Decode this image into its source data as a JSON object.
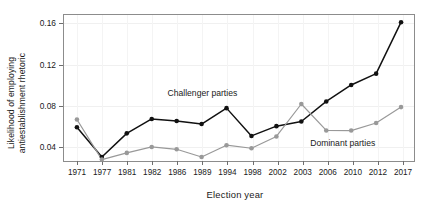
{
  "chart_data": {
    "type": "line",
    "title": "",
    "xlabel": "Election year",
    "ylabel": "Likelihood of employing antiestablishment rhetoric",
    "ylabel_lines": [
      "Likelihood of employing",
      "antiestablishment rhetoric"
    ],
    "categories": [
      "1971",
      "1977",
      "1981",
      "1982",
      "1986",
      "1989",
      "1994",
      "1998",
      "2002",
      "2003",
      "2006",
      "2010",
      "2012",
      "2017"
    ],
    "x_tick_labels": [
      "1971",
      "1977",
      "1981",
      "1982",
      "1986",
      "1989",
      "1994",
      "1998",
      "2002",
      "2003",
      "2006",
      "2010",
      "2012",
      "2017"
    ],
    "y_tick_labels": [
      "0.04",
      "0.08",
      "0.12",
      "0.16"
    ],
    "y_ticks": [
      0.04,
      0.08,
      0.12,
      0.16
    ],
    "ylim": [
      0.025,
      0.168
    ],
    "grid": true,
    "legend": "inline-annotations",
    "series": [
      {
        "name": "Challenger parties",
        "color": "#111111",
        "marker": "filled-circle",
        "values": [
          0.059,
          0.03,
          0.053,
          0.067,
          0.065,
          0.062,
          0.0775,
          0.0505,
          0.06,
          0.0645,
          0.084,
          0.1,
          0.111,
          0.161
        ]
      },
      {
        "name": "Dominant parties",
        "color": "#999999",
        "marker": "filled-circle",
        "values": [
          0.0665,
          0.0275,
          0.034,
          0.0398,
          0.0375,
          0.03,
          0.0415,
          0.0385,
          0.05,
          0.0815,
          0.0558,
          0.0557,
          0.063,
          0.0785
        ]
      }
    ],
    "annotations": [
      {
        "text": "Challenger parties",
        "x_year": "1989",
        "value": 0.093
      },
      {
        "text": "Dominant parties",
        "x_year": "2008.5",
        "value": 0.044
      }
    ]
  },
  "colors": {
    "challenger": "#111111",
    "dominant": "#999999",
    "frame": "#8c8c8c",
    "grid": "#f0f0f0",
    "background": "#ffffff"
  }
}
